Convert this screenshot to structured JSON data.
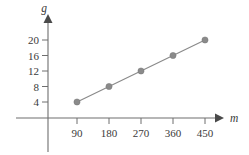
{
  "chart_data": {
    "type": "line",
    "title": "",
    "subtitle": "",
    "xlabel": "m",
    "ylabel": "g",
    "x": [
      90,
      180,
      270,
      360,
      450
    ],
    "values": [
      4,
      8,
      12,
      16,
      20
    ],
    "series": [
      {
        "name": "g vs m",
        "values": [
          4,
          8,
          12,
          16,
          20
        ]
      }
    ],
    "points": [
      {
        "x": 90,
        "y": 4
      },
      {
        "x": 180,
        "y": 8
      },
      {
        "x": 270,
        "y": 12
      },
      {
        "x": 360,
        "y": 16
      },
      {
        "x": 450,
        "y": 20
      }
    ],
    "xtick_labels": [
      "90",
      "180",
      "270",
      "360",
      "450"
    ],
    "ytick_labels": [
      "4",
      "8",
      "12",
      "16",
      "20"
    ],
    "xlim": [
      0,
      495
    ],
    "ylim": [
      0,
      22
    ],
    "grid": false,
    "legend": false,
    "legend_position": "none",
    "marker": "circle",
    "annotations": [],
    "colors": {
      "line": "#8a8a8a",
      "marker": "#8a8a8a",
      "axis": "#6e6e6e",
      "text": "#3a3a3a",
      "background": "#ffffff"
    }
  },
  "axes": {
    "y_axis_title": "g",
    "x_axis_title": "m",
    "y_ticks": [
      {
        "label": "4"
      },
      {
        "label": "8"
      },
      {
        "label": "12"
      },
      {
        "label": "16"
      },
      {
        "label": "20"
      }
    ],
    "x_ticks": [
      {
        "label": "90"
      },
      {
        "label": "180"
      },
      {
        "label": "270"
      },
      {
        "label": "360"
      },
      {
        "label": "450"
      }
    ]
  }
}
